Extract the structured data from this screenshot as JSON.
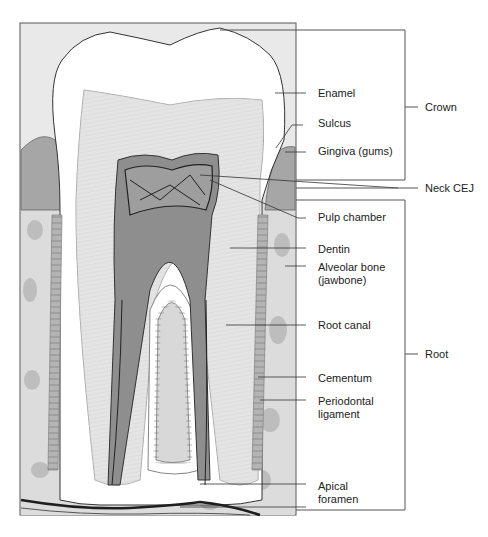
{
  "colors": {
    "background": "#ffffff",
    "panel": "#e6e6e6",
    "enamel": "#ffffff",
    "dentin": "#d2d2d2",
    "pulp": "#8e8e8e",
    "gingiva": "#a6a6a6",
    "bone": "#dadada",
    "bone_spots": "#bcbcbc",
    "ligament": "#b4b4b4",
    "nerve": "#1e1e1e",
    "leader": "#333333"
  },
  "labels": [
    {
      "id": "enamel",
      "text": "Enamel"
    },
    {
      "id": "sulcus",
      "text": "Sulcus"
    },
    {
      "id": "gingiva",
      "text": "Gingiva (gums)"
    },
    {
      "id": "pulp_chamber",
      "text": "Pulp chamber"
    },
    {
      "id": "dentin",
      "text": "Dentin"
    },
    {
      "id": "alveolar_bone",
      "text": "Alveolar bone (jawbone)"
    },
    {
      "id": "root_canal",
      "text": "Root canal"
    },
    {
      "id": "cementum",
      "text": "Cementum"
    },
    {
      "id": "periodontal_ligament",
      "text": "Periodontal ligament"
    },
    {
      "id": "apical_foramen",
      "text": "Apical foramen"
    }
  ],
  "regions": [
    {
      "id": "crown",
      "text": "Crown"
    },
    {
      "id": "neck",
      "text": "Neck CEJ"
    },
    {
      "id": "root",
      "text": "Root"
    }
  ]
}
